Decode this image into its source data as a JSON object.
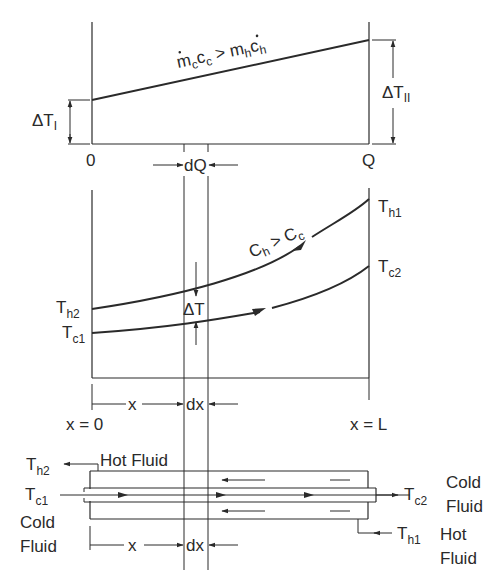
{
  "top_plot": {
    "condition": {
      "m": "m",
      "c_sub": "c",
      "c": "c",
      "c2_sub": "c",
      "gt": ">",
      "m2": "m",
      "h_sub": "h",
      "c3": "c",
      "h2_sub": "h"
    },
    "delta_T_I": {
      "main": "ΔT",
      "sub": "I"
    },
    "delta_T_II": {
      "main": "ΔT",
      "sub": "II"
    },
    "x_start": "0",
    "x_end": "Q",
    "dQ": "dQ"
  },
  "middle_plot": {
    "condition": {
      "C1": "C",
      "s1": "h",
      "gt": ">",
      "C2": "C",
      "s2": "c"
    },
    "Th1": {
      "main": "T",
      "sub": "h1"
    },
    "Tc2": {
      "main": "T",
      "sub": "c2"
    },
    "Th2": {
      "main": "T",
      "sub": "h2"
    },
    "Tc1": {
      "main": "T",
      "sub": "c1"
    },
    "delta_T": "ΔT",
    "x_label": "x",
    "dx_label": "dx",
    "x0_label": "x = 0",
    "xL_label": "x = L"
  },
  "exchanger": {
    "Th2": {
      "main": "T",
      "sub": "h2"
    },
    "Tc1": {
      "main": "T",
      "sub": "c1"
    },
    "Tc2": {
      "main": "T",
      "sub": "c2"
    },
    "Th1": {
      "main": "T",
      "sub": "h1"
    },
    "hot_fluid_top": "Hot Fluid",
    "cold_fluid_left": [
      "Cold",
      "Fluid"
    ],
    "cold_fluid_right": [
      "Cold",
      "Fluid"
    ],
    "hot_fluid_right": [
      "Hot",
      "Fluid"
    ],
    "x_label": "x",
    "dx_label": "dx"
  },
  "colors": {
    "ink": "#2a2a2a",
    "background": "#ffffff"
  }
}
